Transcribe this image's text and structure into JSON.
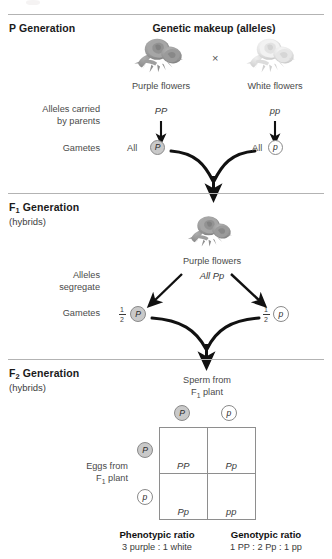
{
  "diagram": {
    "title_center": "Genetic makeup (alleles)",
    "sections": {
      "p": {
        "name": "P Generation",
        "left_flower_label": "Purple flowers",
        "left_genotype": "PP",
        "right_flower_label": "White flowers",
        "right_genotype": "pp",
        "cross_symbol": "×",
        "alleles_label_line1": "Alleles carried",
        "alleles_label_line2": "by parents",
        "gametes_label": "Gametes",
        "left_gamete_qty": "All",
        "left_gamete_allele": "P",
        "right_gamete_qty": "All",
        "right_gamete_allele": "p"
      },
      "f1": {
        "name": "F",
        "name_sub": "1",
        "name_rest": " Generation",
        "subtitle": "(hybrids)",
        "flower_label": "Purple flowers",
        "genotype": "All Pp",
        "segregate_line1": "Alleles",
        "segregate_line2": "segregate",
        "gametes_label": "Gametes",
        "left_gamete_fraction_num": "1",
        "left_gamete_fraction_den": "2",
        "left_gamete_allele": "P",
        "right_gamete_fraction_num": "1",
        "right_gamete_fraction_den": "2",
        "right_gamete_allele": "p"
      },
      "f2": {
        "name": "F",
        "name_sub": "2",
        "name_rest": " Generation",
        "subtitle": "(hybrids)",
        "sperm_label_line1": "Sperm from",
        "sperm_label_line2_pre": "F",
        "sperm_label_line2_sub": "1",
        "sperm_label_line2_post": " plant",
        "eggs_label_line1": "Eggs from",
        "eggs_label_line2_pre": "F",
        "eggs_label_line2_sub": "1",
        "eggs_label_line2_post": " plant",
        "sperm_alleles": [
          "P",
          "p"
        ],
        "egg_alleles": [
          "P",
          "p"
        ],
        "punnett_cells": [
          {
            "genotype": "PP",
            "phenotype": "purple"
          },
          {
            "genotype": "Pp",
            "phenotype": "purple"
          },
          {
            "genotype": "Pp",
            "phenotype": "purple"
          },
          {
            "genotype": "pp",
            "phenotype": "white"
          }
        ],
        "phenotypic_ratio_header": "Phenotypic ratio",
        "phenotypic_ratio_value": "3 purple : 1 white",
        "genotypic_ratio_header": "Genotypic ratio",
        "genotypic_ratio_value": "1 PP : 2 Pp : 1 pp"
      }
    },
    "colors": {
      "rule": "#b3b3b3",
      "dominant_circle_fill": "#c9c9c9",
      "recessive_circle_fill": "#ffffff",
      "circle_stroke": "#8a8a8a",
      "arrow": "#111111",
      "grid_line": "#8e8e8e",
      "text": "#231f20",
      "purple_flower": "#9a9a9a",
      "white_flower": "#d8d8d8"
    }
  }
}
